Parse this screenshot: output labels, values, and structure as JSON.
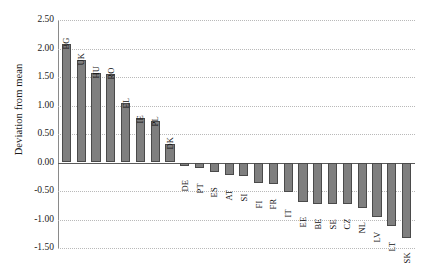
{
  "chart_data": {
    "type": "bar",
    "title": "",
    "subtitle": "",
    "xlabel": "",
    "ylabel": "Deviation from mean",
    "ylim": [
      -1.5,
      2.5
    ],
    "ytick_step": 0.5,
    "ytick_labels": [
      "2.50",
      "2.00",
      "1.50",
      "1.00",
      "0.50",
      "0.00",
      "-0.50",
      "-1.00",
      "-1.50"
    ],
    "ytick_values": [
      2.5,
      2.0,
      1.5,
      1.0,
      0.5,
      0.0,
      -0.5,
      -1.0,
      -1.5
    ],
    "grid": true,
    "grid_style": "dotted-horizontal",
    "legend": "none",
    "bar_color": "#7f7f7f",
    "bar_border_color": "#4a4a4a",
    "gridline_color": "#b9b9b9",
    "axis_color": "#5a5a5a",
    "categories": [
      "BG",
      "UK",
      "HU",
      "RO",
      "EL",
      "IE",
      "PL",
      "DK",
      "DE",
      "PT",
      "ES",
      "AT",
      "SI",
      "FI",
      "FR",
      "IT",
      "EE",
      "BE",
      "SE",
      "CZ",
      "NL",
      "LV",
      "LT",
      "SK"
    ],
    "values": [
      2.08,
      1.8,
      1.57,
      1.56,
      1.05,
      0.78,
      0.72,
      0.32,
      -0.06,
      -0.1,
      -0.16,
      -0.22,
      -0.23,
      -0.36,
      -0.38,
      -0.52,
      -0.7,
      -0.72,
      -0.72,
      -0.73,
      -0.8,
      -0.95,
      -1.12,
      -1.33
    ]
  }
}
